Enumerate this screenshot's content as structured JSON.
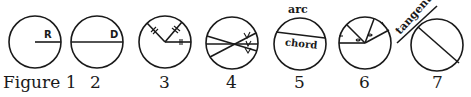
{
  "figure": {
    "panels": [
      {
        "number_label": "Figure 1",
        "concept": "radius",
        "labels": [
          "R"
        ]
      },
      {
        "number_label": "2",
        "concept": "diameter",
        "labels": [
          "D"
        ]
      },
      {
        "number_label": "3",
        "concept": "equal radii",
        "labels": []
      },
      {
        "number_label": "4",
        "concept": "intersecting chords",
        "labels": []
      },
      {
        "number_label": "5",
        "concept": "arc and chord",
        "labels": [
          "arc",
          "chord"
        ]
      },
      {
        "number_label": "6",
        "concept": "central angles",
        "labels": []
      },
      {
        "number_label": "7",
        "concept": "tangent",
        "labels": [
          "tangent"
        ]
      }
    ],
    "colors": {
      "ink": "#1a1a1a",
      "background": "#ffffff"
    }
  }
}
